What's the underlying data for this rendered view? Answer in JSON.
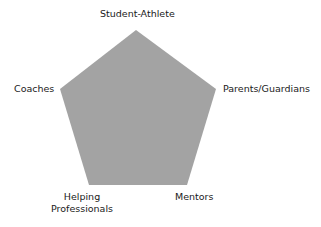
{
  "diagram": {
    "type": "pentagon",
    "fill_color": "#a3a3a3",
    "vertices": [
      {
        "label": "Student-Athlete",
        "position": "top"
      },
      {
        "label": "Parents/Guardians",
        "position": "right"
      },
      {
        "label": "Mentors",
        "position": "bottom-right"
      },
      {
        "label": "Helping Professionals",
        "line1": "Helping",
        "line2": "Professionals",
        "position": "bottom-left"
      },
      {
        "label": "Coaches",
        "position": "left"
      }
    ]
  }
}
